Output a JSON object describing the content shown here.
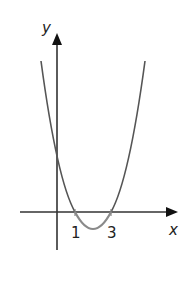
{
  "diagram": {
    "type": "function-graph",
    "axes": {
      "x_label": "x",
      "y_label": "y"
    },
    "x_ticks": [
      {
        "value": 1,
        "label": "1"
      },
      {
        "value": 3,
        "label": "3"
      }
    ],
    "curve": {
      "kind": "parabola",
      "roots": [
        1,
        3
      ],
      "opens": "up",
      "color": "#555555",
      "between_roots_color": "#8a8a8a"
    },
    "colors": {
      "axis": "#222222",
      "background": "#ffffff"
    }
  }
}
